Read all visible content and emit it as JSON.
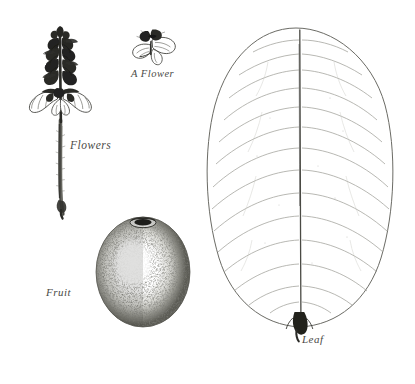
{
  "plate": {
    "background_color": "#ffffff",
    "ink_color": "#3a3a36",
    "vein_color": "#9a9a95",
    "caption_color": "#4a4a46",
    "figures": [
      {
        "id": "flowering-spike",
        "label": "Flowers",
        "description": "Erect flowering spike with dense imbricate bracts and spreading open flowers at the base on a slender hairy stem"
      },
      {
        "id": "single-flower",
        "label": "A Flower",
        "description": "Detail of a single flower with dark hooded upper lip and pale spreading lower corolla lobes"
      },
      {
        "id": "fruit",
        "label": "Fruit",
        "description": "Ovoid stippled berry with persistent calyx scar at the apex and a pale central highlight"
      },
      {
        "id": "leaf",
        "label": "Leaf",
        "description": "Broad obovate leaf with entire margin, prominent midrib, short dark petiole and many arching lateral veins"
      }
    ]
  },
  "captions": {
    "flowers": "Flowers",
    "a_flower": "A Flower",
    "fruit": "Fruit",
    "leaf": "Leaf"
  }
}
